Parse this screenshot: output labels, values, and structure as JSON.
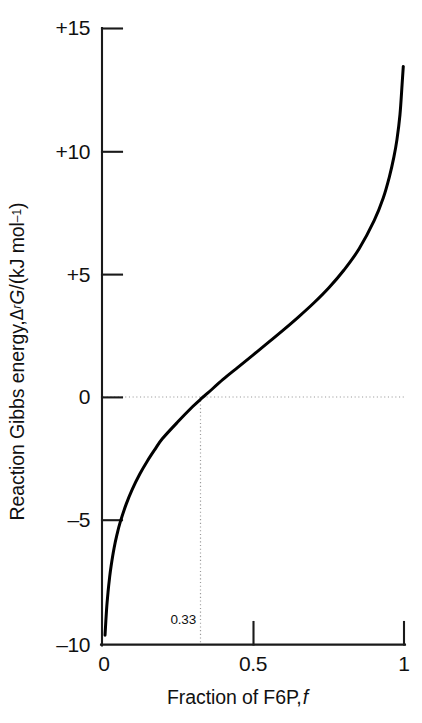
{
  "chart_data": {
    "type": "line",
    "title": "",
    "xlabel": "Fraction of F6P, f",
    "ylabel": "Reaction Gibbs energy, ΔrG/(kJ mol⁻¹)",
    "xlim": [
      0,
      1
    ],
    "ylim": [
      -10,
      15
    ],
    "grid": false,
    "legend": "none",
    "x_ticks": [
      {
        "value": 0,
        "label": "0"
      },
      {
        "value": 0.5,
        "label": "0.5"
      },
      {
        "value": 1,
        "label": "1"
      }
    ],
    "y_ticks": [
      {
        "value": 15,
        "label": "+15"
      },
      {
        "value": 10,
        "label": "+10"
      },
      {
        "value": 5,
        "label": "+5"
      },
      {
        "value": 0,
        "label": "0"
      },
      {
        "value": -5,
        "label": "–5"
      },
      {
        "value": -10,
        "label": "–10"
      }
    ],
    "annotations": [
      {
        "name": "equilibrium-fraction",
        "label": "0.33",
        "x": 0.33,
        "y": 0,
        "style": "dotted-crosshair"
      }
    ],
    "series": [
      {
        "name": "Reaction Gibbs energy",
        "color": "#000000",
        "line_width": 3,
        "x": [
          0.005,
          0.01,
          0.015,
          0.02,
          0.025,
          0.03,
          0.04,
          0.05,
          0.06,
          0.08,
          0.1,
          0.125,
          0.15,
          0.175,
          0.2,
          0.25,
          0.3,
          0.33,
          0.35,
          0.4,
          0.45,
          0.5,
          0.55,
          0.6,
          0.65,
          0.7,
          0.75,
          0.8,
          0.85,
          0.9,
          0.93,
          0.95,
          0.965,
          0.975,
          0.985,
          0.992,
          0.996
        ],
        "y": [
          -11.36,
          -9.62,
          -8.59,
          -7.86,
          -7.29,
          -6.82,
          -6.08,
          -5.51,
          -5.04,
          -4.3,
          -3.7,
          -3.08,
          -2.55,
          -2.08,
          -1.64,
          -0.97,
          -0.34,
          0.0,
          0.21,
          0.76,
          1.26,
          1.76,
          2.26,
          2.77,
          3.3,
          3.86,
          4.48,
          5.2,
          6.06,
          7.21,
          8.13,
          8.98,
          9.79,
          10.49,
          11.5,
          12.72,
          13.46
        ]
      }
    ],
    "curve_model": {
      "formula": "dG = dG_standard + R*T*ln(f/(1-f))",
      "dG_standard_kJ_per_mol": 1.76,
      "RT_kJ_per_mol": 2.479,
      "zero_crossing_f": 0.33,
      "visible_start": {
        "x": 0.01,
        "y": -9.3
      },
      "visible_end": {
        "x": 1.0,
        "y": 12.7
      }
    }
  },
  "axes": {
    "x_title": "Fraction of F6P,",
    "x_title_italic": "f",
    "y_title_part1": "Reaction Gibbs energy, ",
    "y_title_delta": "Δ",
    "y_title_sub": "r",
    "y_title_G": "G",
    "y_title_part2": "/(kJ mol",
    "y_title_sup": "–1",
    "y_title_part3": ")"
  },
  "colors": {
    "curve": "#000000",
    "axis": "#1a1a1a",
    "dotted": "#9a9a9a",
    "background": "#ffffff",
    "text": "#111111"
  }
}
